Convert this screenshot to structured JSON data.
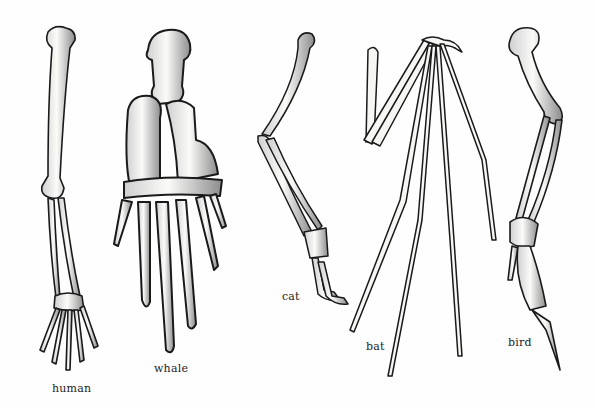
{
  "figure": {
    "labels": {
      "human": "human",
      "whale": "whale",
      "cat": "cat",
      "bat": "bat",
      "bird": "bird"
    },
    "colors": {
      "ink": "#1a1a1a",
      "bone": "#f4f4f2",
      "shade": "#9a9a9a",
      "background": "#fefefe"
    }
  }
}
